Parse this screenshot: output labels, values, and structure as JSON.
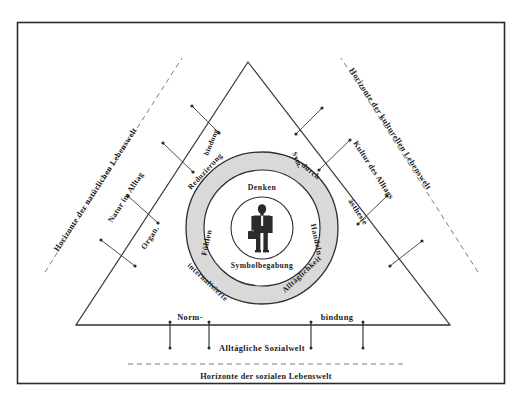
{
  "diagram": {
    "title_note": "Alltagsweltliches Modell - Horizonte der Lebenswelt",
    "horizons": {
      "natural": "Horizonte der natürlichen Lebenswelt",
      "cultural": "Horizonte der kulturellen Lebenswelt",
      "social": "Horizonte der sozialen Lebenswelt"
    },
    "triangle_corners": {
      "left_upper": "Natur im Alltag",
      "left_lower": "Organ.",
      "right_upper": "Kultur des Alltags",
      "right_lower": "ästhesie",
      "apex_left": "bindung",
      "apex_right": "Sym."
    },
    "base": {
      "left_label": "Norm-",
      "right_label": "bindung",
      "center_label": "Alltägliche Sozialwelt"
    },
    "outer_ring": {
      "top_left": "Reduzierung",
      "top_right": "durch",
      "bottom_left": "internalisierte",
      "bottom_right": "Alltäglichkeit"
    },
    "middle_ring": {
      "top": "Denken",
      "left": "Fühlen",
      "right": "Handeln",
      "bottom": "Symbolbegabung"
    },
    "center": {
      "figure": "person-figure-icon"
    },
    "colors": {
      "ring_fill": "#d9d9d9",
      "stroke": "#2f2f2f",
      "frame": "#2b2b2b",
      "dash": "#7c7c7c"
    }
  }
}
